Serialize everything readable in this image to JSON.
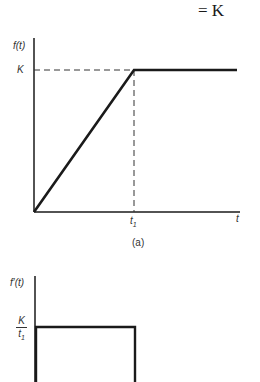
{
  "header": {
    "equation_fragment": "= K"
  },
  "figure_a": {
    "y_axis_label": "f(t)",
    "level_label": "K",
    "x_tick_label": "t",
    "x_tick_subscript": "1",
    "x_axis_label": "t",
    "caption": "(a)"
  },
  "figure_b": {
    "y_axis_label": "f′(t)",
    "level_numerator": "K",
    "level_denominator": "t",
    "level_denominator_subscript": "1"
  },
  "colors": {
    "line": "#1a1a1a",
    "dashed": "#333333",
    "background": "#ffffff"
  }
}
